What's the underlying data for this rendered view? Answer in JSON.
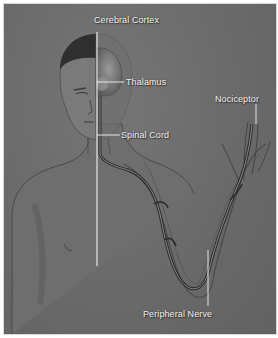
{
  "diagram": {
    "type": "anatomical-illustration",
    "background_color": "#6b6b6b",
    "line_color": "#e8e8e8",
    "labels": [
      {
        "id": "cerebral-cortex",
        "text": "Cerebral Cortex"
      },
      {
        "id": "thalamus",
        "text": "Thalamus"
      },
      {
        "id": "nociceptor",
        "text": "Nociceptor"
      },
      {
        "id": "spinal-cord",
        "text": "Spinal Cord"
      },
      {
        "id": "peripheral-nerve",
        "text": "Peripheral Nerve"
      }
    ]
  }
}
